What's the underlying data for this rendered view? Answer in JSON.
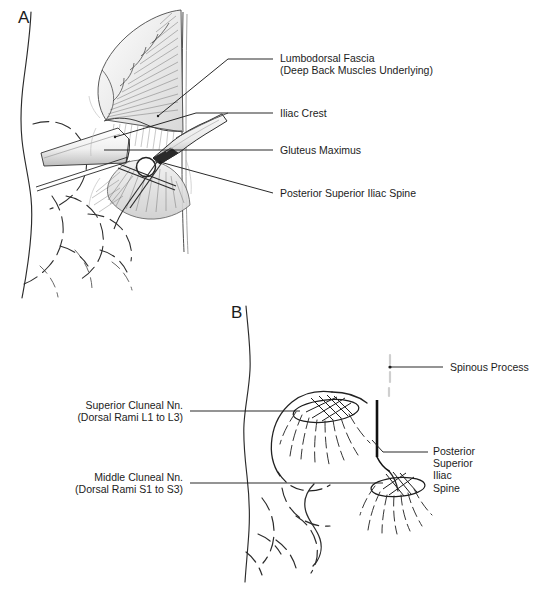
{
  "figure": {
    "background_color": "#ffffff",
    "ink_color": "#1c1c1c",
    "width": 541,
    "height": 593,
    "panels": [
      {
        "id": "A",
        "letter": "A",
        "caption": "Surgical exposure of the posterior iliac crest"
      },
      {
        "id": "B",
        "letter": "B",
        "caption": "Cluneal nerve distribution over the buttock"
      }
    ]
  },
  "panel_a": {
    "letter": "A",
    "annotations": [
      {
        "name": "lumbodorsal-fascia",
        "line1": "Lumbodorsal Fascia",
        "line2": "(Deep Back Muscles Underlying)",
        "text": "Lumbodorsal Fascia\n(Deep Back Muscles Underlying)"
      },
      {
        "name": "iliac-crest",
        "text": "Iliac Crest"
      },
      {
        "name": "gluteus-maximus",
        "text": "Gluteus Maximus"
      },
      {
        "name": "posterior-superior-iliac-spine",
        "text": "Posterior Superior Iliac Spine"
      }
    ]
  },
  "panel_b": {
    "letter": "B",
    "annotations": [
      {
        "name": "superior-cluneal-nerves",
        "line1": "Superior Cluneal Nn.",
        "line2": "(Dorsal Rami L1 to L3)",
        "text": "Superior Cluneal Nn.\n(Dorsal Rami L1 to L3)"
      },
      {
        "name": "middle-cluneal-nerves",
        "line1": "Middle Cluneal Nn.",
        "line2": "(Dorsal Rami S1 to S3)",
        "text": "Middle Cluneal Nn.\n(Dorsal Rami S1 to S3)"
      },
      {
        "name": "spinous-process",
        "text": "Spinous Process"
      },
      {
        "name": "posterior-superior-iliac-spine",
        "line1": "Posterior",
        "line2": "Superior",
        "line3": "Iliac",
        "line4": "Spine",
        "text": "Posterior\nSuperior\nIliac\nSpine"
      }
    ]
  }
}
